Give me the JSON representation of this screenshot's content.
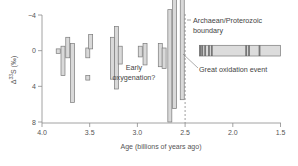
{
  "chart_data": {
    "type": "range-bar",
    "title": "",
    "xlabel": "Age (billions of years ago)",
    "ylabel": "Δ33S (‰)",
    "ylabel_parts": {
      "delta": "Δ",
      "sup": "33",
      "main": "S (‰)"
    },
    "xlim": [
      4.0,
      1.5
    ],
    "ylim": [
      -4,
      8
    ],
    "y_inverted": true,
    "grid": false,
    "x_ticks": [
      "4.0",
      "3.5",
      "3.0",
      "2.5",
      "2.0",
      "1.5"
    ],
    "y_ticks": [
      "-4",
      "0",
      "4",
      "8"
    ],
    "ranges": [
      {
        "age": 3.83,
        "min": -0.2,
        "max": 0.3
      },
      {
        "age": 3.78,
        "min": -0.5,
        "max": 2.8
      },
      {
        "age": 3.73,
        "min": -1.5,
        "max": 0.8
      },
      {
        "age": 3.68,
        "min": -0.8,
        "max": 5.8
      },
      {
        "age": 3.52,
        "min": -0.3,
        "max": 0.8
      },
      {
        "age": 3.52,
        "min": 2.8,
        "max": 3.3
      },
      {
        "age": 3.49,
        "min": -1.8,
        "max": -0.2
      },
      {
        "age": 3.26,
        "min": -1.5,
        "max": 3.2
      },
      {
        "age": 3.22,
        "min": -2.7,
        "max": 4.3
      },
      {
        "age": 3.18,
        "min": -0.5,
        "max": 1.5
      },
      {
        "age": 2.97,
        "min": -0.5,
        "max": 0.7
      },
      {
        "age": 2.92,
        "min": -0.8,
        "max": 1.6
      },
      {
        "age": 2.76,
        "min": -0.8,
        "max": 1.8
      },
      {
        "age": 2.72,
        "min": -0.3,
        "max": 2.0
      },
      {
        "age": 2.66,
        "min": -4.6,
        "max": 8.0
      },
      {
        "age": 2.61,
        "min": -8.0,
        "max": 6.5
      },
      {
        "age": 2.53,
        "min": -6.5,
        "max": 5.5
      }
    ],
    "band": {
      "age_start": 2.35,
      "age_end": 1.5,
      "min": -0.6,
      "max": 0.6,
      "dark_stripes_ages": [
        2.34,
        2.32,
        2.29,
        2.25,
        2.22,
        1.86,
        1.83,
        1.72
      ]
    },
    "reference_line": {
      "age": 2.5,
      "style": "dashed",
      "label": "Archaean/Proterozoic boundary"
    },
    "annotations": [
      {
        "text": "Early oxygenation?",
        "lines": [
          "Early",
          "oxygenation?"
        ]
      },
      {
        "text": "Archaean/Proterozoic boundary",
        "lines": [
          "Archaean/Proterozoic",
          "boundary"
        ]
      },
      {
        "text": "Great oxidation event",
        "lines": [
          "Great oxidation event"
        ]
      }
    ]
  },
  "colors": {
    "axis": "#8c8c8c",
    "bar_fill": "#d9d9d9",
    "bar_stroke": "#7a7a7a",
    "band_fill": "#dcdcdc",
    "stripe_dark": "#555555",
    "text": "#555555"
  }
}
